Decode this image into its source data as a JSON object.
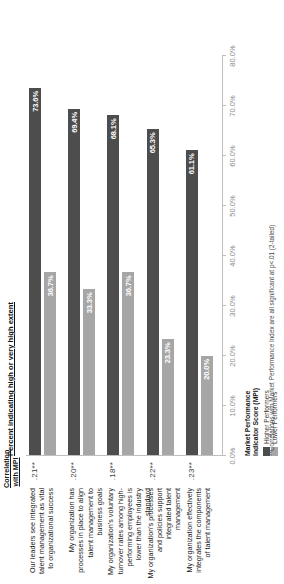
{
  "chart_data": {
    "type": "bar",
    "title": "Percent indicating high or very high extent",
    "xlabel": "Percent indicating high or very high extent",
    "ylabel": "",
    "xlim": [
      0,
      80
    ],
    "grid": false,
    "orientation": "horizontal",
    "legend_position": "bottom-left",
    "tick_labels": [
      "0.0%",
      "10.0%",
      "20.0%",
      "30.0%",
      "40.0%",
      "50.0%",
      "60.0%",
      "70.0%",
      "80.0%"
    ],
    "tick_values": [
      0,
      10,
      20,
      30,
      40,
      50,
      60,
      70,
      80
    ],
    "categories": [
      "Our leaders see integrated talent management as vital to organizational success",
      "My organization has processes in place to align talent management to business goals",
      "My organization's voluntary turnover rates among high-performing employees is lower than the industry standard",
      "My organization's processes and policies support integrated talent management",
      "My organization effectively integrates the components of talent management"
    ],
    "series": [
      {
        "name": "Higher Performers",
        "color": "#4d4d4d",
        "values": [
          73.6,
          69.4,
          68.1,
          65.3,
          61.1
        ],
        "labels": [
          "73.6%",
          "69.4%",
          "68.1%",
          "65.3%",
          "61.1%"
        ]
      },
      {
        "name": "Lower Performers",
        "color": "#a6a6a6",
        "values": [
          36.7,
          33.3,
          36.7,
          23.3,
          20.0
        ],
        "labels": [
          "36.7%",
          "33.3%",
          "36.7%",
          "23.3%",
          "20.0%"
        ]
      }
    ],
    "annotations": {
      "correlation_header": "Correlation with MPI",
      "correlation_values": [
        ".21**",
        ".20**",
        ".18**",
        ".22**",
        ".23**"
      ]
    },
    "footnote": "**Correlations with Market Performance Index are all significant at  p<.01 (2-tailed)"
  },
  "legend": {
    "title_line1": "Market Performance",
    "title_line2": "Indicator Score (MPI)"
  }
}
